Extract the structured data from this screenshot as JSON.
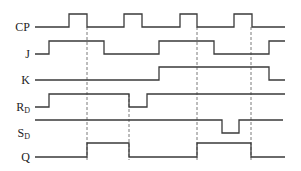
{
  "diagram": {
    "type": "timing-diagram",
    "x_start": 35,
    "x_end": 285,
    "signals": [
      {
        "name": "CP",
        "label": "CP",
        "label_sub": "",
        "y_low": 27,
        "y_high": 14,
        "initial": 0,
        "transitions": [
          69,
          87,
          124,
          142,
          180,
          197,
          234,
          252
        ],
        "end": 285
      },
      {
        "name": "J",
        "label": "J",
        "label_sub": "",
        "y_low": 54,
        "y_high": 41,
        "initial": 0,
        "transitions": [
          49,
          104,
          159,
          214,
          269
        ],
        "end": 285
      },
      {
        "name": "K",
        "label": "K",
        "label_sub": "",
        "y_low": 80,
        "y_high": 67,
        "initial": 0,
        "transitions": [
          159,
          269
        ],
        "end": 285
      },
      {
        "name": "RD",
        "label": "R",
        "label_sub": "D",
        "y_low": 107,
        "y_high": 94,
        "initial": 0,
        "transitions": [
          49,
          129,
          147
        ],
        "end": 285
      },
      {
        "name": "SD",
        "label": "S",
        "label_sub": "D",
        "y_low": 133,
        "y_high": 120,
        "initial": 1,
        "transitions": [
          222,
          239
        ],
        "end": 283
      },
      {
        "name": "Q",
        "label": "Q",
        "label_sub": "",
        "y_low": 157,
        "y_high": 143,
        "initial": 0,
        "transitions": [
          87,
          129,
          197,
          251
        ],
        "end": 285
      }
    ],
    "dashed_lines": [
      {
        "x": 87,
        "y1": 27,
        "y2": 160
      },
      {
        "x": 129,
        "y1": 94,
        "y2": 160
      },
      {
        "x": 197,
        "y1": 27,
        "y2": 160
      },
      {
        "x": 251,
        "y1": 27,
        "y2": 160
      }
    ]
  }
}
